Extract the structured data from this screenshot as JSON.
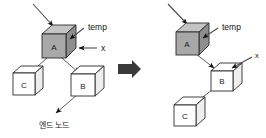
{
  "figure": {
    "width": 266,
    "height": 138,
    "background": "#ffffff",
    "colors": {
      "shaded_node_front": "#a8a8a8",
      "shaded_node_top": "#c4c4c4",
      "shaded_node_side": "#8e8e8e",
      "plain_node_front": "#ffffff",
      "plain_node_side": "#efefef",
      "outline": "#2b2b2b",
      "edge": "#4d4d4d",
      "arrow_head": "#111111",
      "transition_arrow": "#3a3a3a",
      "text": "#111111"
    }
  },
  "left_panel": {
    "name": "before-state",
    "nodes": [
      {
        "id": "A",
        "label": "A",
        "style": "shaded",
        "x": 56,
        "y": 42
      },
      {
        "id": "C",
        "label": "C",
        "style": "plain",
        "x": 25,
        "y": 84
      },
      {
        "id": "B",
        "label": "B",
        "style": "plain",
        "x": 84,
        "y": 85
      }
    ],
    "edges": [
      {
        "from": "A",
        "to": "C",
        "arrow": true
      },
      {
        "from": "A",
        "to": "B",
        "arrow": true
      },
      {
        "from": "B",
        "to": "end-node",
        "arrow": true
      }
    ],
    "pointers": [
      {
        "name": "temp",
        "label": "temp",
        "target": "A",
        "direction": "from-right-down"
      },
      {
        "name": "x",
        "label": "x",
        "target": "A",
        "direction": "from-right"
      },
      {
        "name": "incoming",
        "label": "",
        "target": "A",
        "direction": "from-upper-left"
      }
    ],
    "caption": "엔드 노드"
  },
  "transition": {
    "name": "transition-arrow",
    "symbol": "➡",
    "direction": "right"
  },
  "right_panel": {
    "name": "after-state",
    "nodes": [
      {
        "id": "A",
        "label": "A",
        "style": "shaded",
        "x": 190,
        "y": 40
      },
      {
        "id": "B",
        "label": "B",
        "style": "plain",
        "x": 222,
        "y": 79
      },
      {
        "id": "C",
        "label": "C",
        "style": "plain",
        "x": 185,
        "y": 113
      }
    ],
    "edges": [
      {
        "from": "A",
        "to": "B",
        "arrow": true
      },
      {
        "from": "B",
        "to": "C",
        "arrow": true
      }
    ],
    "pointers": [
      {
        "name": "temp",
        "label": "temp",
        "target": "A",
        "direction": "from-right-down"
      },
      {
        "name": "x",
        "label": "x",
        "target": "B",
        "direction": "from-upper-right"
      },
      {
        "name": "incoming",
        "label": "",
        "target": "A",
        "direction": "from-upper-left"
      }
    ],
    "caption": ""
  },
  "labels": {
    "node_a": "A",
    "node_b": "B",
    "node_c": "C",
    "temp": "temp",
    "x": "x",
    "end_node_caption": "엔드 노드"
  }
}
